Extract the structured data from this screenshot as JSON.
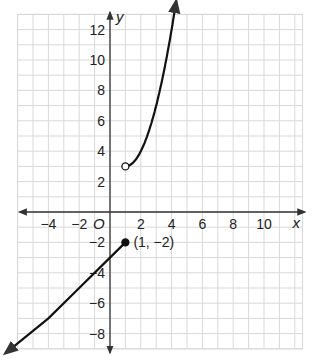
{
  "chart_data": {
    "type": "line",
    "title": "",
    "xlabel": "x",
    "ylabel": "y",
    "origin_label": "O",
    "xlim": [
      -6,
      12.5
    ],
    "ylim": [
      -9,
      13
    ],
    "grid": true,
    "grid_step": 1,
    "x_ticks": [
      -4,
      -2,
      2,
      4,
      6,
      8,
      10
    ],
    "y_ticks": [
      12,
      10,
      8,
      6,
      4,
      2,
      -2,
      -4,
      -6,
      -8
    ],
    "x_tick_labels": [
      "−4",
      "−2",
      "2",
      "4",
      "6",
      "8",
      "10"
    ],
    "y_tick_labels": [
      "12",
      "10",
      "8",
      "6",
      "4",
      "2",
      "−2",
      "−4",
      "−6",
      "−8"
    ],
    "series": [
      {
        "name": "upper piece (curve)",
        "kind": "curve",
        "description": "y = (x - 1)^2 + 3 for x > 1, arrow upward",
        "start_point": {
          "x": 1,
          "y": 3,
          "endpoint": "open"
        },
        "points": [
          [
            1,
            3
          ],
          [
            1.5,
            3.25
          ],
          [
            2,
            4
          ],
          [
            2.5,
            5.25
          ],
          [
            3,
            7
          ],
          [
            3.5,
            9.25
          ],
          [
            4,
            12
          ],
          [
            4.3,
            13.9
          ]
        ],
        "arrow_end": true
      },
      {
        "name": "lower piece (line)",
        "kind": "line",
        "description": "y = x - 3 for x <= 1, arrow downward-left",
        "start_point": {
          "x": 1,
          "y": -2,
          "endpoint": "closed"
        },
        "points": [
          [
            1,
            -2
          ],
          [
            0,
            -3
          ],
          [
            -2,
            -5
          ],
          [
            -4,
            -7
          ],
          [
            -6.8,
            -9.3
          ]
        ],
        "arrow_end": true
      }
    ],
    "annotations": [
      {
        "text": "(1, −2)",
        "x": 1,
        "y": -2
      }
    ],
    "colors": {
      "grid": "#d9d9d9",
      "axis": "#333333",
      "curve": "#111111"
    }
  }
}
